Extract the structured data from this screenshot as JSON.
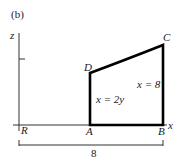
{
  "figure": {
    "panel_label": "(b)",
    "axes": {
      "vertical_label": "z",
      "horizontal_label": "x"
    },
    "points": {
      "R": "R",
      "A": "A",
      "B": "B",
      "C": "C",
      "D": "D"
    },
    "equations": {
      "left_edge": "x = 2y",
      "right_edge": "x = 8"
    },
    "dimension": {
      "label": "8"
    },
    "colors": {
      "stroke": "#000000",
      "text": "#1a1a1a",
      "background": "#ffffff"
    }
  }
}
